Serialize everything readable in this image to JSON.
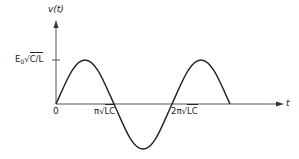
{
  "diagram": {
    "type": "sinusoid-plot",
    "y_axis_label": "v(t)",
    "x_axis_label": "t",
    "origin_label": "0",
    "amplitude_label": {
      "prefix": "E",
      "subscript": "0",
      "radical": "√",
      "radicand": "C/L"
    },
    "x_ticks": [
      {
        "prefix": "π",
        "radical": "√",
        "radicand": "LC"
      },
      {
        "prefix": "2π",
        "radical": "√",
        "radicand": "LC"
      }
    ],
    "curve": "v(t) = E0√(C/L) sin(t/√(LC)), plotted from t = 0 to t = 2.5π√(LC) (1.25 periods)",
    "colors": {
      "stroke": "#222222",
      "axis": "#555555",
      "background": "#ffffff"
    }
  }
}
